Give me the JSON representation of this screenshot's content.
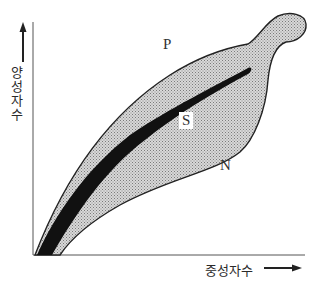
{
  "diagram": {
    "y_axis_label": "양성자수",
    "x_axis_label": "중성자수",
    "region_labels": {
      "proton_rich_edge": "P",
      "stable_band": "S",
      "neutron_rich_edge": "N"
    },
    "colors": {
      "band_fill": "#c4c4c4",
      "stable_fill": "#111111",
      "axis": "#555555",
      "outline": "#222222"
    }
  }
}
